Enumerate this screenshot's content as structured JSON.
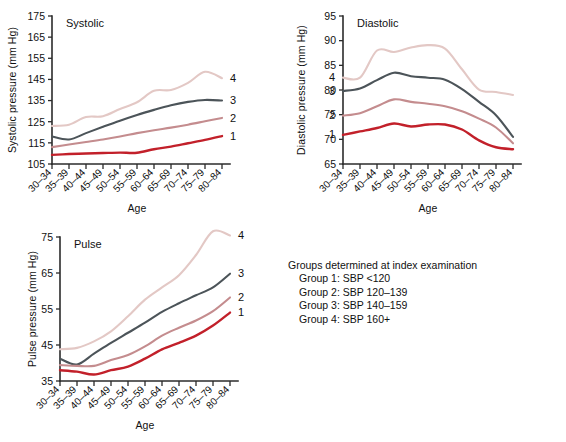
{
  "figure": {
    "background": "#ffffff",
    "group_colors": {
      "group1": "#c2202a",
      "group2": "#c48c8e",
      "group3": "#4c5459",
      "group4": "#e3c8c5"
    },
    "axis_color": "#2b2b2b"
  },
  "legend": {
    "header": "Groups determined at index examination",
    "items": [
      "Group 1: SBP <120",
      "Group 2: SBP 120–139",
      "Group 3: SBP 140–159",
      "Group 4: SBP 160+"
    ]
  },
  "series_labels": [
    "1",
    "2",
    "3",
    "4"
  ],
  "chart_data": [
    {
      "type": "line",
      "id": "systolic",
      "title": "Systolic",
      "xlabel": "Age",
      "ylabel": "Systolic pressure (mm Hg)",
      "ylim": [
        105,
        175
      ],
      "yticks": [
        105,
        115,
        125,
        135,
        145,
        155,
        165,
        175
      ],
      "grid": false,
      "legend_position": "right-of-line-ends",
      "categories": [
        "30–34",
        "35–39",
        "40–44",
        "45–49",
        "50–54",
        "55–59",
        "60–64",
        "65–69",
        "70–74",
        "75–79",
        "80–84"
      ],
      "series": [
        {
          "name": "1",
          "label": "1",
          "color": "#c2202a",
          "values": [
            109.3,
            109.7,
            110.0,
            110.2,
            110.4,
            110.3,
            112.0,
            113.2,
            114.8,
            116.4,
            118.2
          ]
        },
        {
          "name": "2",
          "label": "2",
          "color": "#c48c8e",
          "values": [
            113.0,
            114.2,
            115.4,
            116.6,
            118.0,
            119.6,
            121.0,
            122.2,
            123.6,
            125.2,
            126.8
          ]
        },
        {
          "name": "3",
          "label": "3",
          "color": "#4c5459",
          "values": [
            118.0,
            116.6,
            119.6,
            122.6,
            125.5,
            128.2,
            130.6,
            132.8,
            134.4,
            135.3,
            135.0
          ]
        },
        {
          "name": "4",
          "label": "4",
          "color": "#e3c8c5",
          "values": [
            123.0,
            123.6,
            127.2,
            127.6,
            131.0,
            134.2,
            139.6,
            140.0,
            143.4,
            148.6,
            145.6
          ]
        }
      ]
    },
    {
      "type": "line",
      "id": "diastolic",
      "title": "Diastolic",
      "xlabel": "Age",
      "ylabel": "Diastolic pressure (mm Hg)",
      "ylim": [
        65,
        95
      ],
      "yticks": [
        65,
        70,
        75,
        80,
        85,
        90,
        95
      ],
      "grid": false,
      "legend_position": "left-of-line-starts",
      "categories": [
        "30–34",
        "35–39",
        "40–44",
        "45–49",
        "50–54",
        "55–59",
        "60–64",
        "65–69",
        "70–74",
        "75–79",
        "80–84"
      ],
      "series": [
        {
          "name": "1",
          "label": "1",
          "color": "#c2202a",
          "values": [
            70.9,
            71.6,
            72.3,
            73.2,
            72.6,
            73.0,
            73.0,
            72.0,
            69.8,
            68.4,
            68.0
          ]
        },
        {
          "name": "2",
          "label": "2",
          "color": "#c48c8e",
          "values": [
            74.8,
            75.3,
            76.7,
            78.1,
            77.6,
            77.2,
            76.7,
            75.7,
            74.2,
            72.4,
            69.2
          ]
        },
        {
          "name": "3",
          "label": "3",
          "color": "#4c5459",
          "values": [
            79.8,
            80.3,
            82.0,
            83.5,
            82.8,
            82.5,
            82.1,
            80.2,
            77.6,
            74.9,
            70.5
          ]
        },
        {
          "name": "4",
          "label": "4",
          "color": "#e3c8c5",
          "values": [
            82.5,
            82.5,
            88.0,
            87.7,
            88.6,
            89.1,
            88.4,
            84.2,
            80.1,
            79.6,
            79.0
          ]
        }
      ]
    },
    {
      "type": "line",
      "id": "pulse",
      "title": "Pulse",
      "xlabel": "Age",
      "ylabel": "Pulse pressure (mm Hg)",
      "ylim": [
        35,
        75
      ],
      "yticks": [
        35,
        45,
        55,
        65,
        75
      ],
      "grid": false,
      "legend_position": "right-of-line-ends",
      "categories": [
        "30–34",
        "35–39",
        "40–44",
        "45–49",
        "50–54",
        "55–59",
        "60–64",
        "65–69",
        "70–74",
        "75–79",
        "80–84"
      ],
      "series": [
        {
          "name": "1",
          "label": "1",
          "color": "#c2202a",
          "values": [
            38.0,
            37.6,
            36.8,
            38.0,
            39.0,
            41.2,
            43.8,
            45.6,
            47.6,
            50.4,
            54.0
          ]
        },
        {
          "name": "2",
          "label": "2",
          "color": "#c48c8e",
          "values": [
            39.4,
            39.2,
            39.2,
            40.8,
            42.2,
            44.6,
            47.6,
            49.8,
            51.8,
            54.4,
            58.2
          ]
        },
        {
          "name": "3",
          "label": "3",
          "color": "#4c5459",
          "values": [
            41.2,
            39.6,
            42.6,
            45.6,
            48.4,
            51.2,
            54.2,
            56.6,
            58.8,
            61.0,
            64.8
          ]
        },
        {
          "name": "4",
          "label": "4",
          "color": "#e3c8c5",
          "values": [
            43.8,
            44.2,
            46.0,
            48.8,
            53.0,
            57.6,
            61.0,
            64.4,
            70.0,
            76.6,
            75.4
          ]
        }
      ]
    }
  ]
}
